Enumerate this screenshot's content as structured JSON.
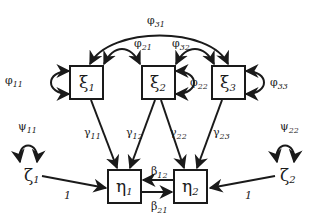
{
  "diagram": {
    "type": "structural-equation-path-diagram",
    "colors": {
      "stroke": "#1a1a1a",
      "background": "#ffffff"
    },
    "exogenous": [
      {
        "id": "xi1",
        "symbol": "ξ",
        "sub": "1"
      },
      {
        "id": "xi2",
        "symbol": "ξ",
        "sub": "2"
      },
      {
        "id": "xi3",
        "symbol": "ξ",
        "sub": "3"
      }
    ],
    "endogenous": [
      {
        "id": "eta1",
        "symbol": "η",
        "sub": "1"
      },
      {
        "id": "eta2",
        "symbol": "η",
        "sub": "2"
      }
    ],
    "disturbances": [
      {
        "id": "zeta1",
        "symbol": "ζ",
        "sub": "1"
      },
      {
        "id": "zeta2",
        "symbol": "ζ",
        "sub": "2"
      }
    ],
    "variances": {
      "phi11": {
        "symbol": "φ",
        "sub": "11"
      },
      "phi22": {
        "symbol": "φ",
        "sub": "22"
      },
      "phi33": {
        "symbol": "φ",
        "sub": "33"
      },
      "psi11": {
        "symbol": "ψ",
        "sub": "11"
      },
      "psi22": {
        "symbol": "ψ",
        "sub": "22"
      }
    },
    "covariances": {
      "phi21": {
        "symbol": "φ",
        "sub": "21"
      },
      "phi32": {
        "symbol": "φ",
        "sub": "32"
      },
      "phi31": {
        "symbol": "φ",
        "sub": "31"
      }
    },
    "paths": {
      "gamma11": {
        "symbol": "γ",
        "sub": "11"
      },
      "gamma12": {
        "symbol": "γ",
        "sub": "12"
      },
      "gamma22": {
        "symbol": "γ",
        "sub": "22"
      },
      "gamma23": {
        "symbol": "γ",
        "sub": "23"
      },
      "beta12": {
        "symbol": "β",
        "sub": "12"
      },
      "beta21": {
        "symbol": "β",
        "sub": "21"
      }
    },
    "disturbance_loadings": {
      "zeta1": "1",
      "zeta2": "1"
    }
  }
}
